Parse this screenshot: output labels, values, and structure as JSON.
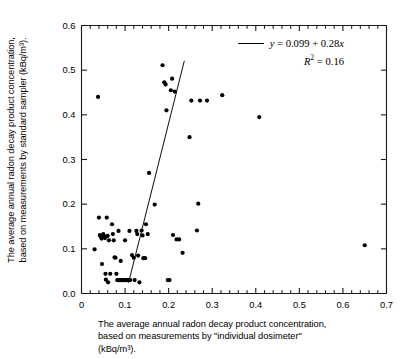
{
  "figure": {
    "y_axis_title_lines": [
      "The average annual radon decay product concentration,",
      "based on measurements by standard sampler  (kBq/m³)."
    ],
    "x_axis_caption_lines": [
      "The average annual radon decay product concentration,",
      "based on measurements by \"individual dosimeter\"",
      "(kBq/m³)."
    ]
  },
  "legend": {
    "equation": "y = 0.099 + 0.28x",
    "equation_lhs": "y",
    "equation_rhs": " = 0.099 + 0.28",
    "equation_var": "x",
    "r2_symbol": "R",
    "r2_exp": "2",
    "r2_value": " = 0.16",
    "r2_full": "R² = 0.16",
    "line_color": "#000000"
  },
  "chart_data": {
    "type": "scatter",
    "title": "",
    "xlabel": "The average annual radon decay product concentration, based on measurements by \"individual dosimeter\" (kBq/m³).",
    "ylabel": "The average annual radon decay product concentration, based on measurements by standard sampler (kBq/m³).",
    "xlim": [
      0,
      0.7
    ],
    "ylim": [
      0.0,
      0.6
    ],
    "xticks": [
      0,
      0.1,
      0.2,
      0.3,
      0.4,
      0.5,
      0.6,
      0.7
    ],
    "xtick_labels": [
      "0",
      "0.1",
      "0.2",
      "0.3",
      "0.4",
      "0.5",
      "0.6",
      "0.7"
    ],
    "yticks": [
      0.0,
      0.1,
      0.2,
      0.3,
      0.4,
      0.5,
      0.6
    ],
    "ytick_labels": [
      "0.0",
      "0.1",
      "0.2",
      "0.3",
      "0.4",
      "0.5",
      "0.6"
    ],
    "minor_tick_step": 0.02,
    "grid": false,
    "marker": "filled-circle",
    "marker_color": "#000000",
    "marker_size_px": 4.2,
    "legend_position": "top-right",
    "regression": {
      "slope": 0.28,
      "intercept": 0.099,
      "r_squared": 0.16,
      "x_start": 0.108,
      "x_end": 0.236,
      "y_start": 0.024,
      "y_end": 0.521,
      "note": "drawn line is steeper than stated equation"
    },
    "points": [
      [
        0.03,
        0.099
      ],
      [
        0.038,
        0.44
      ],
      [
        0.04,
        0.17
      ],
      [
        0.042,
        0.131
      ],
      [
        0.044,
        0.128
      ],
      [
        0.046,
        0.123
      ],
      [
        0.047,
        0.066
      ],
      [
        0.05,
        0.133
      ],
      [
        0.052,
        0.128
      ],
      [
        0.054,
        0.124
      ],
      [
        0.055,
        0.044
      ],
      [
        0.056,
        0.031
      ],
      [
        0.058,
        0.17
      ],
      [
        0.06,
        0.129
      ],
      [
        0.061,
        0.025
      ],
      [
        0.063,
        0.119
      ],
      [
        0.066,
        0.044
      ],
      [
        0.07,
        0.155
      ],
      [
        0.072,
        0.133
      ],
      [
        0.074,
        0.119
      ],
      [
        0.076,
        0.081
      ],
      [
        0.078,
        0.08
      ],
      [
        0.08,
        0.044
      ],
      [
        0.082,
        0.03
      ],
      [
        0.085,
        0.14
      ],
      [
        0.086,
        0.03
      ],
      [
        0.088,
        0.03
      ],
      [
        0.09,
        0.073
      ],
      [
        0.092,
        0.03
      ],
      [
        0.094,
        0.03
      ],
      [
        0.096,
        0.03
      ],
      [
        0.098,
        0.03
      ],
      [
        0.1,
        0.119
      ],
      [
        0.102,
        0.03
      ],
      [
        0.104,
        0.03
      ],
      [
        0.106,
        0.03
      ],
      [
        0.108,
        0.03
      ],
      [
        0.11,
        0.14
      ],
      [
        0.112,
        0.03
      ],
      [
        0.116,
        0.086
      ],
      [
        0.12,
        0.08
      ],
      [
        0.122,
        0.03
      ],
      [
        0.126,
        0.14
      ],
      [
        0.128,
        0.133
      ],
      [
        0.13,
        0.085
      ],
      [
        0.133,
        0.025
      ],
      [
        0.138,
        0.141
      ],
      [
        0.14,
        0.13
      ],
      [
        0.142,
        0.079
      ],
      [
        0.146,
        0.079
      ],
      [
        0.148,
        0.155
      ],
      [
        0.152,
        0.133
      ],
      [
        0.155,
        0.27
      ],
      [
        0.168,
        0.199
      ],
      [
        0.186,
        0.511
      ],
      [
        0.19,
        0.473
      ],
      [
        0.193,
        0.468
      ],
      [
        0.195,
        0.41
      ],
      [
        0.198,
        0.03
      ],
      [
        0.202,
        0.03
      ],
      [
        0.205,
        0.455
      ],
      [
        0.208,
        0.481
      ],
      [
        0.21,
        0.131
      ],
      [
        0.214,
        0.452
      ],
      [
        0.218,
        0.121
      ],
      [
        0.224,
        0.121
      ],
      [
        0.232,
        0.091
      ],
      [
        0.248,
        0.35
      ],
      [
        0.252,
        0.432
      ],
      [
        0.265,
        0.141
      ],
      [
        0.268,
        0.201
      ],
      [
        0.272,
        0.432
      ],
      [
        0.288,
        0.432
      ],
      [
        0.323,
        0.444
      ],
      [
        0.408,
        0.395
      ],
      [
        0.65,
        0.108
      ]
    ]
  }
}
